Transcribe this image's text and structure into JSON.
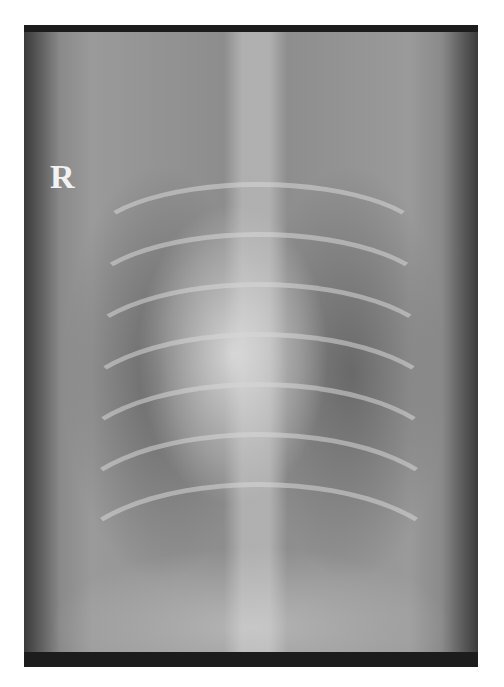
{
  "image": {
    "kind": "radiograph",
    "description": "Ventrodorsal thoracic radiograph",
    "side_marker": "R"
  }
}
